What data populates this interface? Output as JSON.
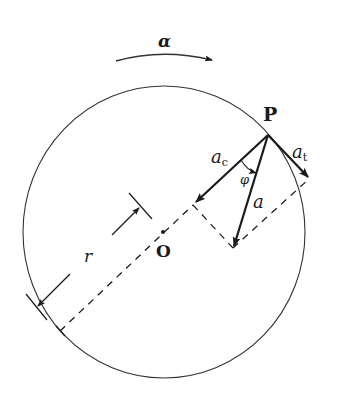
{
  "diagram": {
    "type": "circular-motion-acceleration",
    "colors": {
      "stroke": "#1a1a1a",
      "background": "#ffffff",
      "thin": "#333333"
    },
    "circle": {
      "cx": 164,
      "cy": 232,
      "rx": 141,
      "ry": 146
    },
    "labels": {
      "alpha": "α",
      "P": "P",
      "O": "O",
      "r": "r",
      "a": "a",
      "ac_main": "a",
      "ac_sub": "c",
      "at_main": "a",
      "at_sub": "t",
      "phi": "φ"
    },
    "points": {
      "P": [
        268,
        135
      ],
      "O": [
        163,
        232
      ],
      "a_tip": [
        233,
        248
      ],
      "ac_tip": [
        195,
        203
      ],
      "at_tip": [
        309,
        178
      ]
    }
  }
}
